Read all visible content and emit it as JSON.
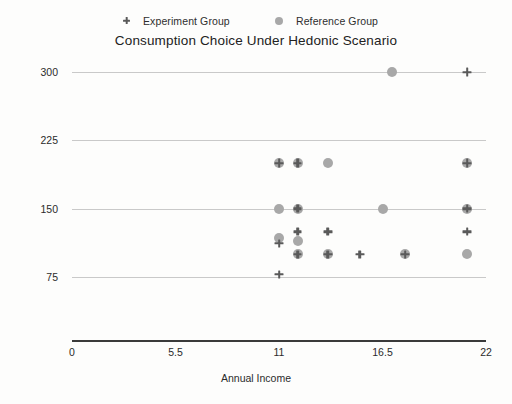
{
  "chart_data": {
    "type": "scatter",
    "title": "Consumption Choice Under Hedonic Scenario",
    "xlabel": "Annual Income",
    "ylabel": "Price Range Chosen",
    "xlim": [
      0,
      22
    ],
    "ylim": [
      75,
      300
    ],
    "xticks": [
      "0",
      "5.5",
      "11",
      "16.5",
      "22"
    ],
    "xtick_values": [
      0,
      5.5,
      11,
      16.5,
      22
    ],
    "yticks": [
      "300",
      "225",
      "150",
      "75"
    ],
    "ytick_values": [
      300,
      225,
      150,
      75
    ],
    "grid": "horizontal",
    "legend_position": "top",
    "colors": {
      "experiment_group": "#5a5a5a",
      "reference_group": "#a8a8a8",
      "gridline": "#c9c9c9",
      "axis": "#3a3a3a",
      "text": "#2b2b2b",
      "background": "#fdfdfc"
    },
    "series": [
      {
        "name": "Experiment Group",
        "marker": "plus",
        "color": "#5a5a5a",
        "points": [
          {
            "x": 21.0,
            "y": 300
          },
          {
            "x": 11.0,
            "y": 200
          },
          {
            "x": 12.0,
            "y": 200
          },
          {
            "x": 21.0,
            "y": 200
          },
          {
            "x": 12.0,
            "y": 150
          },
          {
            "x": 21.0,
            "y": 150
          },
          {
            "x": 12.0,
            "y": 125
          },
          {
            "x": 13.6,
            "y": 125
          },
          {
            "x": 21.0,
            "y": 125
          },
          {
            "x": 11.0,
            "y": 112
          },
          {
            "x": 12.0,
            "y": 100
          },
          {
            "x": 13.6,
            "y": 100
          },
          {
            "x": 15.3,
            "y": 100
          },
          {
            "x": 17.7,
            "y": 100
          },
          {
            "x": 11.0,
            "y": 78
          }
        ]
      },
      {
        "name": "Reference Group",
        "marker": "circle",
        "color": "#a8a8a8",
        "points": [
          {
            "x": 17.0,
            "y": 300
          },
          {
            "x": 11.0,
            "y": 200
          },
          {
            "x": 12.0,
            "y": 200
          },
          {
            "x": 13.6,
            "y": 200
          },
          {
            "x": 21.0,
            "y": 200
          },
          {
            "x": 11.0,
            "y": 150
          },
          {
            "x": 12.0,
            "y": 150
          },
          {
            "x": 16.5,
            "y": 150
          },
          {
            "x": 21.0,
            "y": 150
          },
          {
            "x": 11.0,
            "y": 118
          },
          {
            "x": 12.0,
            "y": 115
          },
          {
            "x": 12.0,
            "y": 100
          },
          {
            "x": 13.6,
            "y": 100
          },
          {
            "x": 17.7,
            "y": 100
          },
          {
            "x": 21.0,
            "y": 100
          }
        ]
      }
    ]
  }
}
